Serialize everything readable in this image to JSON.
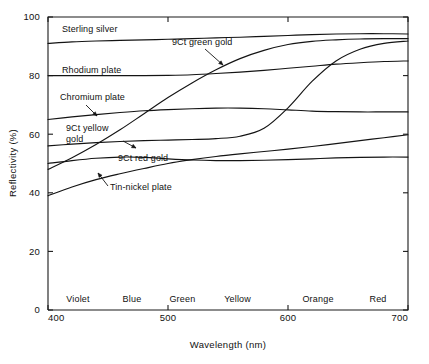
{
  "chart_data": {
    "type": "line",
    "title": "",
    "xlabel": "Wavelength (nm)",
    "ylabel": "Reflectivity (%)",
    "xlim": [
      400,
      700
    ],
    "ylim": [
      0,
      100
    ],
    "xticks": [
      400,
      500,
      600,
      700
    ],
    "yticks": [
      0,
      20,
      40,
      60,
      80,
      100
    ],
    "grid": false,
    "legend_position": "inline-annotations",
    "x_band_labels": [
      {
        "label": "Violet",
        "center": 425
      },
      {
        "label": "Blue",
        "center": 470
      },
      {
        "label": "Green",
        "center": 512
      },
      {
        "label": "Yellow",
        "center": 558
      },
      {
        "label": "Orange",
        "center": 625
      },
      {
        "label": "Red",
        "center": 675
      }
    ],
    "x": [
      400,
      420,
      440,
      460,
      480,
      500,
      520,
      540,
      560,
      580,
      600,
      620,
      640,
      660,
      680,
      700
    ],
    "series": [
      {
        "name": "Sterling silver",
        "values": [
          91.0,
          91.5,
          91.8,
          92.0,
          92.2,
          92.4,
          92.6,
          92.9,
          93.1,
          93.4,
          93.7,
          94.0,
          94.2,
          94.3,
          94.3,
          94.2
        ]
      },
      {
        "name": "Rhodium plate",
        "values": [
          80.0,
          80.0,
          80.0,
          80.0,
          80.0,
          80.1,
          80.3,
          80.7,
          81.2,
          81.8,
          82.5,
          83.2,
          83.9,
          84.4,
          84.8,
          85.0
        ]
      },
      {
        "name": "Chromium plate",
        "values": [
          65.0,
          65.9,
          66.7,
          67.4,
          68.0,
          68.4,
          68.7,
          68.9,
          68.9,
          68.7,
          68.3,
          67.9,
          67.7,
          67.6,
          67.6,
          67.6
        ]
      },
      {
        "name": "9Ct yellow gold",
        "values": [
          56.0,
          56.6,
          57.1,
          57.5,
          57.8,
          58.0,
          58.2,
          58.5,
          59.3,
          62.0,
          69.0,
          78.0,
          85.0,
          89.0,
          91.0,
          91.8
        ]
      },
      {
        "name": "9Ct red gold",
        "values": [
          50.0,
          51.0,
          51.8,
          52.2,
          52.1,
          51.6,
          51.2,
          51.0,
          51.0,
          51.1,
          51.3,
          51.6,
          51.9,
          52.1,
          52.2,
          52.2
        ]
      },
      {
        "name": "9Ct green gold",
        "values": [
          48.0,
          52.0,
          56.5,
          61.5,
          67.0,
          72.5,
          77.5,
          82.0,
          85.8,
          88.6,
          90.6,
          91.7,
          92.2,
          92.5,
          92.6,
          92.6
        ]
      },
      {
        "name": "Tin-nickel plate",
        "values": [
          39.0,
          42.0,
          44.5,
          46.5,
          48.3,
          50.0,
          51.3,
          52.4,
          53.3,
          54.1,
          54.9,
          55.8,
          56.8,
          57.8,
          58.8,
          59.8
        ]
      }
    ],
    "annotations": [
      {
        "label": "Sterling silver",
        "text_x": 62,
        "text_y": 32,
        "anchor": "start",
        "leader": null
      },
      {
        "label": "Rhodium plate",
        "text_x": 62,
        "text_y": 73,
        "anchor": "start",
        "leader": null
      },
      {
        "label": "Chromium plate",
        "text_x": 60,
        "text_y": 100,
        "anchor": "start",
        "leader": [
          [
            86,
            105
          ],
          [
            97,
            116
          ]
        ]
      },
      {
        "label": "9Ct yellow gold",
        "text_x": 66,
        "text_y": 131,
        "anchor": "start",
        "leader": [
          [
            123,
            141
          ],
          [
            136,
            148
          ]
        ]
      },
      {
        "label": "9Ct red gold",
        "text_x": 118,
        "text_y": 161,
        "anchor": "start",
        "leader": null
      },
      {
        "label": "Tin-nickel plate",
        "text_x": 110,
        "text_y": 190,
        "anchor": "start",
        "leader": [
          [
            108,
            186
          ],
          [
            98,
            173
          ]
        ]
      },
      {
        "label": "9Ct green gold",
        "text_x": 172,
        "text_y": 45,
        "anchor": "start",
        "leader": [
          [
            205,
            49
          ],
          [
            223,
            65
          ]
        ]
      }
    ]
  },
  "figure": {
    "caption": ""
  }
}
